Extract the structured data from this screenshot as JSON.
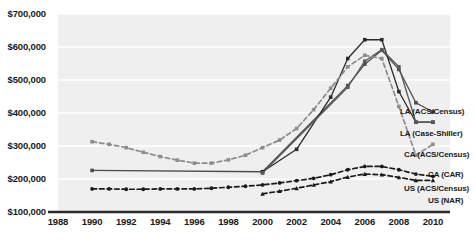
{
  "chart_data": {
    "type": "line",
    "title": "",
    "subtitle": "",
    "xlabel": "",
    "ylabel": "",
    "xlim": [
      1988,
      2011
    ],
    "ylim": [
      100000,
      700000
    ],
    "grid": true,
    "legend_position": "inline-right",
    "x_ticks": [
      "1988",
      "1990",
      "1992",
      "1994",
      "1996",
      "1998",
      "2000",
      "2002",
      "2004",
      "2006",
      "2008",
      "2010"
    ],
    "x_tick_values": [
      1988,
      1990,
      1992,
      1994,
      1996,
      1998,
      2000,
      2002,
      2004,
      2006,
      2008,
      2010
    ],
    "y_ticks": [
      "$100,000",
      "$200,000",
      "$300,000",
      "$400,000",
      "$500,000",
      "$600,000",
      "$700,000"
    ],
    "y_tick_values": [
      100000,
      200000,
      300000,
      400000,
      500000,
      600000,
      700000
    ],
    "series": [
      {
        "name": "LA (ACS/Census)",
        "style": "solid",
        "color": "#4d4d4d",
        "marker": "square",
        "x": [
          1990,
          2000,
          2005,
          2006,
          2007,
          2008,
          2009,
          2010
        ],
        "values": [
          226000,
          222000,
          483000,
          548000,
          590000,
          532000,
          431000,
          403000
        ]
      },
      {
        "name": "LA (Case-Shiller)",
        "style": "solid",
        "color": "#2b2b2b",
        "marker": "square",
        "x": [
          2000,
          2002,
          2004,
          2005,
          2006,
          2007,
          2008,
          2009,
          2010
        ],
        "values": [
          222000,
          290000,
          448000,
          565000,
          622000,
          622000,
          465000,
          372000,
          372000
        ]
      },
      {
        "name": "CA (ACS/Census)",
        "style": "solid",
        "color": "#595959",
        "marker": "square",
        "x": [
          2000,
          2005,
          2006,
          2007,
          2008,
          2009,
          2010
        ],
        "values": [
          218000,
          478000,
          557000,
          592000,
          540000,
          372000,
          372000
        ]
      },
      {
        "name": "CA (CAR)",
        "style": "dashed",
        "color": "#8c8c8c",
        "marker": "square",
        "x": [
          1990,
          1991,
          1992,
          1993,
          1994,
          1995,
          1996,
          1997,
          1998,
          1999,
          2000,
          2001,
          2002,
          2003,
          2004,
          2005,
          2006,
          2007,
          2008,
          2009,
          2010
        ],
        "values": [
          313000,
          305000,
          295000,
          281000,
          268000,
          257000,
          248000,
          248000,
          258000,
          272000,
          295000,
          318000,
          353000,
          410000,
          475000,
          540000,
          575000,
          565000,
          420000,
          272000,
          305000
        ]
      },
      {
        "name": "US (ACS/Census)",
        "style": "dashed",
        "color": "#1a1a1a",
        "marker": "circle",
        "x": [
          1990,
          1991,
          1992,
          1993,
          1994,
          1995,
          1996,
          1997,
          1998,
          1999,
          2000,
          2001,
          2002,
          2003,
          2004,
          2005,
          2006,
          2007,
          2008,
          2009,
          2010
        ],
        "values": [
          170000,
          170000,
          169000,
          169000,
          170000,
          170000,
          170000,
          172000,
          175000,
          178000,
          182000,
          188000,
          195000,
          202000,
          213000,
          228000,
          238000,
          238000,
          228000,
          215000,
          208000
        ]
      },
      {
        "name": "US (NAR)",
        "style": "dashed",
        "color": "#1a1a1a",
        "marker": "triangle",
        "x": [
          2000,
          2001,
          2002,
          2003,
          2004,
          2005,
          2006,
          2007,
          2008,
          2009,
          2010
        ],
        "values": [
          155000,
          163000,
          172000,
          182000,
          192000,
          206000,
          215000,
          213000,
          205000,
          196000,
          196000
        ]
      }
    ]
  },
  "axes": {
    "y_axis_name": "price-axis",
    "x_axis_name": "year-axis"
  }
}
